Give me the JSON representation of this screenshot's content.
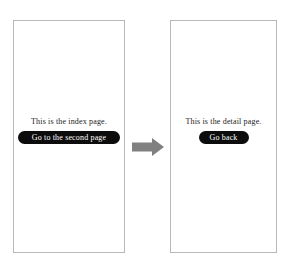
{
  "diagram": {
    "type": "navigation-flow",
    "background_color": "#ffffff",
    "frame_border_color": "#b8b8b8",
    "button_color": "#0c0c0c",
    "button_text_color": "#ffffff",
    "arrow_color": "#808080"
  },
  "screens": [
    {
      "id": "index",
      "label": "This is the index page.",
      "button_label": "Go to the second page"
    },
    {
      "id": "detail",
      "label": "This is the detail page.",
      "button_label": "Go back"
    }
  ],
  "arrow": {
    "icon": "arrow-right-icon",
    "direction": "right"
  }
}
